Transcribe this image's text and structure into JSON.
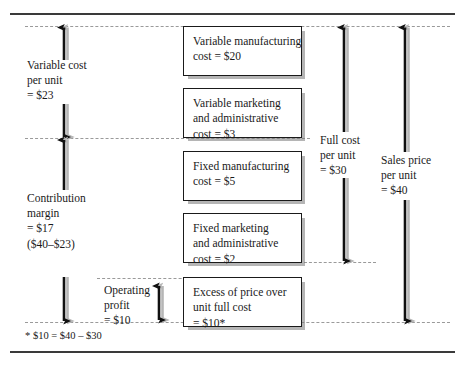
{
  "diagram": {
    "title_footnote": "* $10 = $40 – $30",
    "boxes": [
      {
        "name": "variable-manufacturing-cost",
        "lines": [
          "Variable manufacturing",
          "cost = $20"
        ]
      },
      {
        "name": "variable-marketing-admin-cost",
        "lines": [
          "Variable marketing",
          "and administrative",
          "cost = $3"
        ]
      },
      {
        "name": "fixed-manufacturing-cost",
        "lines": [
          "Fixed manufacturing",
          "cost = $5"
        ]
      },
      {
        "name": "fixed-marketing-admin-cost",
        "lines": [
          "Fixed marketing",
          "and administrative",
          "cost = $2"
        ]
      },
      {
        "name": "excess-of-price-over-unit-full-cost",
        "lines": [
          "Excess of price over",
          "unit full cost",
          "= $10*"
        ]
      }
    ],
    "labels": [
      {
        "name": "variable-cost-per-unit",
        "lines": [
          "Variable cost",
          "per unit",
          "= $23"
        ]
      },
      {
        "name": "contribution-margin",
        "lines": [
          "Contribution",
          "margin",
          "= $17",
          "($40–$23)"
        ]
      },
      {
        "name": "operating-profit",
        "lines": [
          "Operating",
          "profit",
          "= $10"
        ]
      },
      {
        "name": "full-cost-per-unit",
        "lines": [
          "Full cost",
          "per unit",
          "= $30"
        ]
      },
      {
        "name": "sales-price-per-unit",
        "lines": [
          "Sales price",
          "per unit",
          "= $40"
        ]
      }
    ],
    "values": {
      "variable_manufacturing_cost": 20,
      "variable_marketing_admin_cost": 3,
      "fixed_manufacturing_cost": 5,
      "fixed_marketing_admin_cost": 2,
      "variable_cost_per_unit": 23,
      "contribution_margin": 17,
      "full_cost_per_unit": 30,
      "sales_price_per_unit": 40,
      "operating_profit": 10,
      "excess_of_price_over_unit_full_cost": 10
    },
    "colors": {
      "line": "#1a1a1a",
      "shadow": "#8a8a8a",
      "guide": "#9a9a9a",
      "background": "#ffffff"
    }
  }
}
